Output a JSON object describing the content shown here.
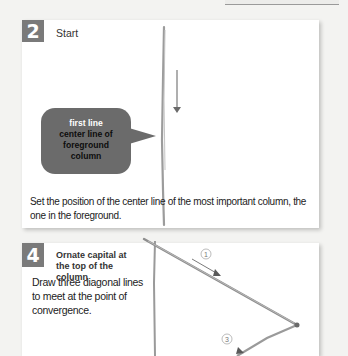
{
  "top_bar": {
    "visible": true
  },
  "steps": [
    {
      "number": "2",
      "title": "Start",
      "bubble": {
        "first_line": "first line",
        "rest": "center line of foreground column",
        "color": "#6b6b6b"
      },
      "caption": "Set the position of the center line of the most important column, the one in the foreground."
    },
    {
      "number": "4",
      "title": "Ornate capital at the top of the column",
      "caption": "Draw three diagonal lines to meet at the point of convergence.",
      "markers": [
        "①",
        "③"
      ]
    }
  ],
  "colors": {
    "badge": "#7a7a7a",
    "pencil": "#8a8a8a",
    "background": "#f3f3f1"
  }
}
